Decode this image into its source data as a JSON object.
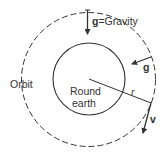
{
  "diagram": {
    "labels": {
      "gravity": "g=Gravity",
      "gravity_bold": "g",
      "gravity_rest": "=Gravity",
      "g_vector": "g",
      "orbit": "Orbit",
      "earth_line1": "Round",
      "earth_line2": "earth",
      "radius": "r",
      "velocity": "v"
    },
    "colors": {
      "stroke": "#333333",
      "background": "#ffffff"
    }
  }
}
